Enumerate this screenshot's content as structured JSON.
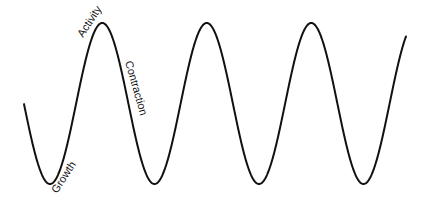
{
  "diagram": {
    "type": "business-cycle-wave",
    "line_color": "#111111",
    "background": "#ffffff",
    "labels": [
      {
        "text": "Activity",
        "phase": "peak"
      },
      {
        "text": "Contraction",
        "phase": "descending"
      },
      {
        "text": "Growth",
        "phase": "trough"
      }
    ],
    "wave": {
      "cycles_visible": 3.8,
      "start": [
        24,
        105
      ],
      "peaks": [
        [
          103,
          23
        ],
        [
          205,
          23
        ],
        [
          310,
          23
        ]
      ],
      "troughs": [
        [
          50,
          183
        ],
        [
          153,
          183
        ],
        [
          259,
          184
        ],
        [
          363,
          184
        ]
      ],
      "end": [
        406,
        33
      ]
    }
  }
}
